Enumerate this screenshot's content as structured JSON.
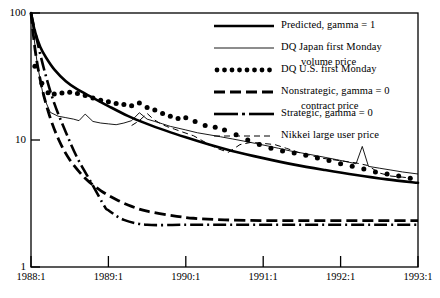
{
  "chart_data": {
    "type": "line",
    "title": "",
    "xlabel": "",
    "ylabel": "",
    "scale": {
      "x": "linear",
      "y": "log"
    },
    "ylim": [
      1,
      100
    ],
    "xlim": [
      "1988:1",
      "1993:1"
    ],
    "ytick_labels": [
      "100",
      "10",
      "1"
    ],
    "ytick_values": [
      100,
      10,
      1
    ],
    "xtick_labels": [
      "1988:1",
      "1989:1",
      "1990:1",
      "1991:1",
      "1992:1",
      "1993:1"
    ],
    "xtick_values": [
      1988.0,
      1989.0,
      1990.0,
      1991.0,
      1992.0,
      1993.0
    ],
    "grid": false,
    "legend_position": "top-right",
    "series": [
      {
        "name": "Predicted, gamma = 1",
        "style": "solid-thick",
        "x": [
          1988.0,
          1988.05,
          1988.12,
          1988.2,
          1988.3,
          1988.45,
          1988.6,
          1988.8,
          1989.0,
          1989.25,
          1989.5,
          1989.75,
          1990.0,
          1990.3,
          1990.6,
          1991.0,
          1991.4,
          1991.8,
          1992.2,
          1992.6,
          1993.0
        ],
        "values": [
          100,
          72,
          54,
          44,
          36,
          29,
          25,
          21.5,
          18.5,
          15.5,
          13.4,
          11.8,
          10.5,
          9.2,
          8.2,
          7.2,
          6.4,
          5.8,
          5.3,
          4.9,
          4.6
        ]
      },
      {
        "name": "DQ Japan first Monday volume price",
        "style": "solid-thin",
        "x": [
          1988.0,
          1988.08,
          1988.16,
          1988.25,
          1988.35,
          1988.45,
          1988.55,
          1988.62,
          1988.7,
          1988.8,
          1988.9,
          1989.0,
          1989.1,
          1989.2,
          1989.3,
          1989.4,
          1989.5,
          1989.6,
          1989.7,
          1989.8,
          1989.9,
          1990.0,
          1990.15,
          1990.3,
          1990.45,
          1990.6,
          1990.75,
          1990.9,
          1991.05,
          1991.2,
          1991.35,
          1991.5,
          1991.65,
          1991.8,
          1991.95,
          1992.1,
          1992.2,
          1992.28,
          1992.36,
          1992.5,
          1992.65,
          1992.8,
          1993.0
        ],
        "values": [
          100,
          40,
          22,
          16.5,
          15.4,
          15.0,
          14.6,
          14.2,
          16.0,
          14.0,
          13.6,
          13.4,
          13.2,
          13.6,
          14.2,
          16.4,
          14.6,
          14.0,
          13.4,
          12.8,
          12.4,
          12.0,
          11.4,
          11.0,
          10.6,
          10.2,
          9.8,
          9.4,
          9.0,
          8.6,
          8.2,
          7.9,
          7.6,
          7.3,
          7.0,
          6.7,
          6.5,
          8.9,
          6.2,
          6.0,
          5.8,
          5.6,
          5.4
        ]
      },
      {
        "name": "DQ U.S. first Monday contract price",
        "style": "dotted",
        "x": [
          1988.05,
          1988.14,
          1988.22,
          1988.3,
          1988.4,
          1988.5,
          1988.6,
          1988.7,
          1988.8,
          1988.9,
          1989.0,
          1989.1,
          1989.2,
          1989.3,
          1989.4,
          1989.5,
          1989.6,
          1989.7,
          1989.8,
          1989.9,
          1990.0,
          1990.12,
          1990.25,
          1990.38,
          1990.5,
          1990.65,
          1990.8,
          1990.95,
          1991.1,
          1991.25,
          1991.4,
          1991.55,
          1991.7,
          1991.85,
          1992.0,
          1992.15,
          1992.3,
          1992.45,
          1992.6,
          1992.75,
          1992.9
        ],
        "values": [
          38,
          28,
          23.5,
          23,
          23.4,
          23.8,
          23.2,
          22.4,
          21.4,
          20.6,
          20.0,
          19.4,
          19.0,
          18.6,
          19.6,
          18.0,
          17.2,
          16.2,
          15.4,
          14.8,
          15.0,
          14.0,
          13.0,
          12.6,
          12.0,
          11.0,
          10.0,
          9.2,
          8.6,
          8.2,
          7.9,
          7.6,
          7.2,
          6.9,
          6.5,
          6.2,
          5.9,
          5.6,
          5.4,
          5.2,
          5.0
        ]
      },
      {
        "name": "Nonstrategic, gamma = 0",
        "style": "dashed-thick",
        "x": [
          1988.0,
          1988.06,
          1988.14,
          1988.24,
          1988.36,
          1988.5,
          1988.7,
          1988.9,
          1989.1,
          1989.3,
          1989.5,
          1989.8,
          1990.1,
          1990.5,
          1991.0,
          1991.5,
          1992.0,
          1992.5,
          1993.0
        ],
        "values": [
          100,
          48,
          26,
          15.5,
          10.0,
          7.0,
          5.0,
          4.0,
          3.4,
          3.0,
          2.75,
          2.55,
          2.42,
          2.35,
          2.32,
          2.32,
          2.32,
          2.32,
          2.32
        ]
      },
      {
        "name": "Strategic, gamma = 0",
        "style": "dashdot",
        "x": [
          1988.0,
          1988.08,
          1988.18,
          1988.3,
          1988.45,
          1988.6,
          1988.78,
          1988.95,
          1989.0,
          1989.2,
          1989.5,
          1990.0,
          1990.5,
          1991.0,
          1991.5,
          1992.0,
          1992.5,
          1993.0
        ],
        "values": [
          100,
          60,
          34,
          19.5,
          11.5,
          7.2,
          4.6,
          3.0,
          2.8,
          2.35,
          2.15,
          2.15,
          2.15,
          2.15,
          2.15,
          2.15,
          2.15,
          2.15
        ]
      },
      {
        "name": "Nikkei large user price",
        "style": "dashed-thin",
        "x": [
          1989.3,
          1989.4,
          1989.5,
          1989.58,
          1989.66,
          1989.75,
          1989.85,
          1989.95,
          1990.1,
          1990.25,
          1990.4,
          1990.55,
          1990.7,
          1990.85,
          1991.0,
          1991.15,
          1991.3,
          1991.45,
          1991.6,
          1991.75,
          1991.9,
          1992.05,
          1992.2,
          1992.35,
          1992.5,
          1992.65,
          1992.8,
          1992.92
        ],
        "values": [
          13.0,
          14.2,
          16.2,
          14.6,
          13.6,
          12.8,
          12.2,
          11.6,
          10.8,
          9.6,
          8.6,
          8.0,
          9.2,
          9.6,
          9.4,
          9.2,
          8.6,
          8.0,
          7.6,
          7.2,
          7.0,
          6.8,
          6.6,
          6.3,
          5.5,
          5.2,
          5.1,
          5.0
        ]
      }
    ]
  },
  "axes": {
    "y_ticks": [
      {
        "label": "100"
      },
      {
        "label": "10"
      },
      {
        "label": "1"
      }
    ],
    "x_ticks": [
      {
        "label": "1988:1"
      },
      {
        "label": "1989:1"
      },
      {
        "label": "1990:1"
      },
      {
        "label": "1991:1"
      },
      {
        "label": "1992:1"
      },
      {
        "label": "1993:1"
      }
    ]
  },
  "legend": {
    "entries": [
      {
        "key": "solid-thick",
        "line1": "Predicted, gamma = 1",
        "line2": ""
      },
      {
        "key": "solid-thin",
        "line1": "DQ Japan first Monday",
        "line2": "volume price"
      },
      {
        "key": "dotted",
        "line1": "DQ U.S. first Monday",
        "line2": "contract price"
      },
      {
        "key": "dashed-thick",
        "line1": "Nonstrategic, gamma = 0",
        "line2": ""
      },
      {
        "key": "dashdot",
        "line1": "Strategic, gamma = 0",
        "line2": ""
      },
      {
        "key": "dashed-thin",
        "line1": "Nikkei large user price",
        "line2": ""
      }
    ]
  },
  "colors": {
    "ink": "#000000",
    "background": "#ffffff"
  }
}
